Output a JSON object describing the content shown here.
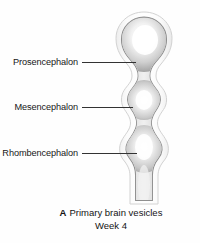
{
  "figure": {
    "name": "primary-brain-vesicles-figure",
    "background_color": "#ffffff"
  },
  "callouts": [
    {
      "id": "prosencephalon",
      "label": "Prosencephalon",
      "leader_line_color": "#333333"
    },
    {
      "id": "mesencephalon",
      "label": "Mesencephalon",
      "leader_line_color": "#333333"
    },
    {
      "id": "rhombencephalon",
      "label": "Rhombencephalon",
      "leader_line_color": "#333333"
    }
  ],
  "caption": {
    "panel_letter": "A",
    "title": "Primary brain vesicles",
    "subtitle": "Week 4"
  },
  "illustration": {
    "name": "neural-tube-diagram",
    "outer_shell_color": "#fbfbfb",
    "outline_color": "#9a9a9a",
    "body_fill_light": "#fdfdfd",
    "body_fill_mid": "#d6d6d6",
    "body_fill_dark": "#9d9d9d",
    "vesicles": [
      "prosencephalon",
      "mesencephalon",
      "rhombencephalon"
    ]
  }
}
